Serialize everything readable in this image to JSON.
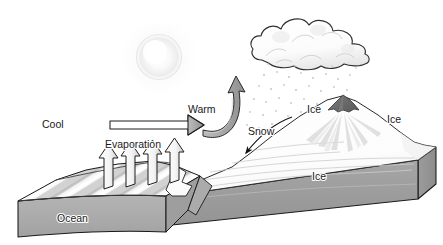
{
  "diagram": {
    "background_color": "#ffffff",
    "width": 443,
    "height": 245,
    "labels": {
      "cool": "Cool",
      "warm": "Warm",
      "evaporation": "Evaporation",
      "snow": "Snow",
      "ocean": "Ocean",
      "ice_peak": "Ice",
      "ice_right": "Ice",
      "ice_sheet": "Ice"
    },
    "colors": {
      "outline": "#1a1a1a",
      "ocean_front_face": "#a8a8a8",
      "ocean_top_light": "#f2f2f2",
      "ocean_top_dark": "#bdbdbd",
      "ice_front_face": "#9a9a9a",
      "ice_top": "#fbfbfb",
      "mountain_rock": "#6e6e6e",
      "arrow_gray": "#9e9e9e",
      "arrow_white": "#ffffff",
      "cloud_fill": "#fdfdfd",
      "cloud_shade": "#d8d8d8",
      "sun_glow": "#f0f0f0",
      "precip_dot": "#c9c9c9",
      "glacier_line": "#cfcfcf"
    },
    "elements": {
      "sun": "sun-glow",
      "cloud": "cumulus-cloud",
      "precipitation": "falling-snow-dots",
      "mountain": "glaciated-peak",
      "evaporation_arrow_count": 4,
      "cool_arrow": "horizontal-hollow-arrow-right",
      "warm_arrow": "curved-ribbon-arrow-up-right",
      "snow_arrow": "thin-curved-arrow-down-left"
    }
  }
}
